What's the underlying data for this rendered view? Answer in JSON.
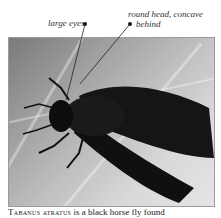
{
  "annotations": [
    {
      "label": "large eyes"
    },
    {
      "label_line1": "round head, concave",
      "label_line2": "behind"
    }
  ],
  "caption": {
    "species": "Tabanus atratus",
    "text": " is a black horse fly found"
  },
  "photo": {
    "subject": "black horse fly",
    "background_colors": [
      "#7a7a7a",
      "#d9d9d9"
    ],
    "fly_color": "#141414"
  }
}
